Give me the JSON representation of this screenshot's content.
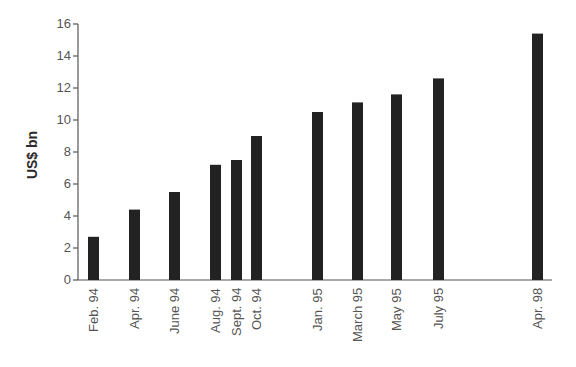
{
  "chart_data": {
    "type": "bar",
    "title": "",
    "xlabel": "",
    "ylabel": "US$ bn",
    "ylim": [
      0,
      16
    ],
    "yticks": [
      0,
      2,
      4,
      6,
      8,
      10,
      12,
      14,
      16
    ],
    "grid": false,
    "legend": null,
    "categories": [
      "Feb. 94",
      "Apr. 94",
      "June 94",
      "Aug. 94",
      "Sept. 94",
      "Oct. 94",
      "Jan. 95",
      "March 95",
      "May 95",
      "July 95",
      "Apr. 98"
    ],
    "values": [
      2.7,
      4.4,
      5.5,
      7.2,
      7.5,
      9.0,
      10.5,
      11.1,
      11.6,
      12.6,
      15.4
    ],
    "bar_color": "#222222"
  }
}
